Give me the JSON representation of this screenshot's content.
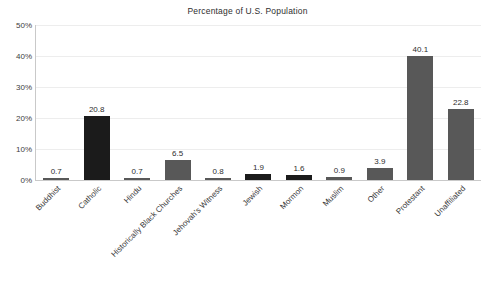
{
  "chart_data": {
    "type": "bar",
    "title": "Percentage of U.S. Population",
    "xlabel": "",
    "ylabel": "",
    "ylim": [
      0,
      50
    ],
    "ytick_labels": [
      "0%",
      "10%",
      "20%",
      "30%",
      "40%",
      "50%"
    ],
    "ytick_values": [
      0,
      10,
      20,
      30,
      40,
      50
    ],
    "grid": true,
    "legend": "none",
    "value_labels": true,
    "categories": [
      "Buddhist",
      "Catholic",
      "Hindu",
      "Historically Black Churches",
      "Jehovah's Witness",
      "Jewish",
      "Mormon",
      "Muslim",
      "Other",
      "Protestant",
      "Unaffiliated"
    ],
    "values": [
      0.7,
      20.8,
      0.7,
      6.5,
      0.8,
      1.9,
      1.6,
      0.9,
      3.9,
      40.1,
      22.8
    ],
    "value_label_text": [
      "0.7",
      "20.8",
      "0.7",
      "6.5",
      "0.8",
      "1.9",
      "1.6",
      "0.9",
      "3.9",
      "40.1",
      "22.8"
    ],
    "bar_colors": [
      "#585858",
      "#1b1b1b",
      "#585858",
      "#585858",
      "#585858",
      "#1b1b1b",
      "#1b1b1b",
      "#585858",
      "#585858",
      "#585858",
      "#585858"
    ],
    "colors": {
      "bar_default": "#585858",
      "bar_dark": "#1b1b1b",
      "gridline": "#ededed",
      "axis": "#c9c9c9",
      "text": "#3a3a3a",
      "background": "#ffffff"
    }
  }
}
